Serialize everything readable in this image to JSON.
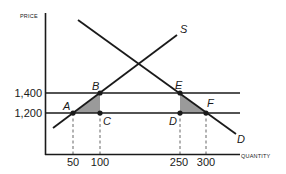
{
  "diagram": {
    "type": "supply-demand",
    "y_axis_label": "PRICE",
    "x_axis_label": "QUANTITY",
    "y_ticks": [
      {
        "value": 1400,
        "label": "1,400"
      },
      {
        "value": 1200,
        "label": "1,200"
      }
    ],
    "x_ticks": [
      {
        "value": 50,
        "label": "50"
      },
      {
        "value": 100,
        "label": "100"
      },
      {
        "value": 250,
        "label": "250"
      },
      {
        "value": 300,
        "label": "300"
      }
    ],
    "curves": [
      {
        "name": "supply",
        "label": "S"
      },
      {
        "name": "demand",
        "label": "D"
      }
    ],
    "points": [
      {
        "label": "A",
        "quantity": 50,
        "price": 1200
      },
      {
        "label": "B",
        "quantity": 100,
        "price": 1400
      },
      {
        "label": "C",
        "quantity": 100,
        "price": 1200
      },
      {
        "label": "D",
        "quantity": 250,
        "price": 1200
      },
      {
        "label": "E",
        "quantity": 250,
        "price": 1400
      },
      {
        "label": "F",
        "quantity": 300,
        "price": 1200
      }
    ],
    "shaded_regions": [
      {
        "vertices": [
          "A",
          "B",
          "C"
        ]
      },
      {
        "vertices": [
          "E",
          "D",
          "F"
        ]
      }
    ],
    "colors": {
      "line": "#1a1a1a",
      "shade": "#9a9a9a",
      "dashed": "#555555"
    }
  }
}
